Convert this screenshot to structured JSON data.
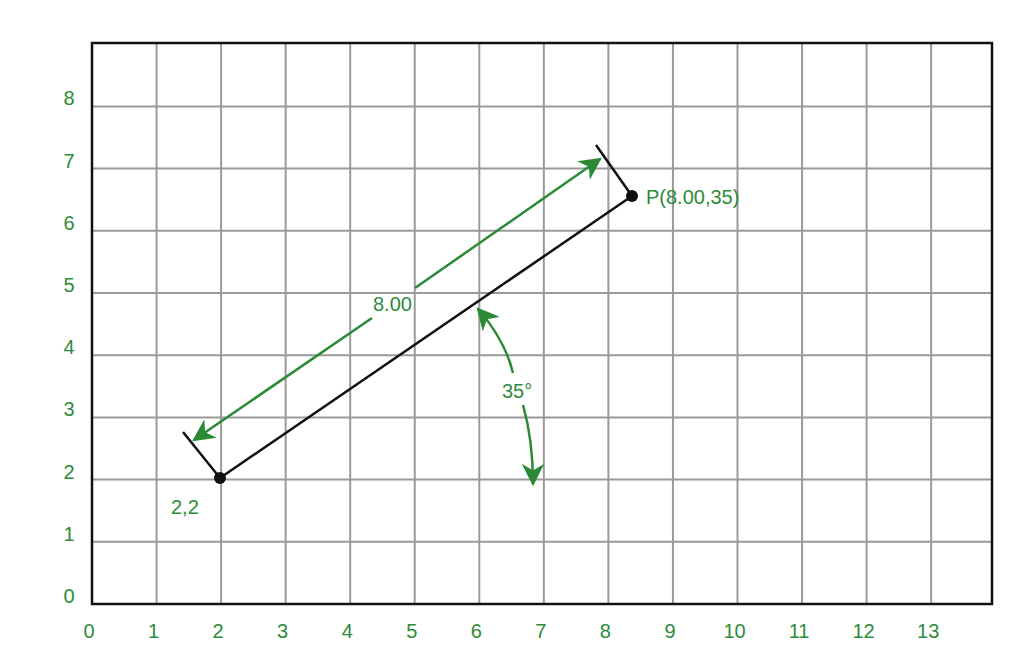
{
  "colors": {
    "accent_green": "#2e8b3a",
    "line_black": "#111111",
    "grid_gray": "#9a9a9a",
    "background": "#ffffff"
  },
  "axes": {
    "x_ticks": [
      "0",
      "1",
      "2",
      "3",
      "4",
      "5",
      "6",
      "7",
      "8",
      "9",
      "10",
      "11",
      "12",
      "13"
    ],
    "y_ticks": [
      "0",
      "1",
      "2",
      "3",
      "4",
      "5",
      "6",
      "7",
      "8"
    ],
    "x_range": [
      0,
      14
    ],
    "y_range": [
      0,
      9
    ]
  },
  "geometry": {
    "start_point": {
      "x": 2,
      "y": 2
    },
    "end_point": {
      "x_approx": 8.55,
      "y_approx": 6.6
    },
    "distance": 8.0,
    "angle_deg": 35
  },
  "labels": {
    "start_point_label": "2,2",
    "end_point_label": "P(8.00,35)",
    "distance_label": "8.00",
    "angle_label": "35°"
  }
}
